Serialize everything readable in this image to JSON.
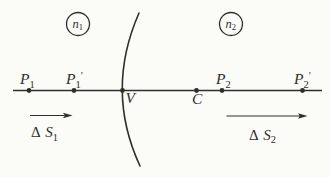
{
  "colors": {
    "background": "#fbfbf8",
    "ink": "#2f2e2c"
  },
  "media": {
    "n1": {
      "base": "n",
      "sub": "1"
    },
    "n2": {
      "base": "n",
      "sub": "2"
    }
  },
  "points": {
    "p1": {
      "base": "P",
      "sub": "1",
      "prime": ""
    },
    "p1_prime": {
      "base": "P",
      "sub": "1",
      "prime": "′"
    },
    "vertex": {
      "base": "V",
      "sub": "",
      "prime": ""
    },
    "center": {
      "base": "C",
      "sub": "",
      "prime": ""
    },
    "p2": {
      "base": "P",
      "sub": "2",
      "prime": ""
    },
    "p2_prime": {
      "base": "P",
      "sub": "2",
      "prime": "′"
    }
  },
  "shifts": {
    "s1": {
      "delta": "Δ",
      "base": "S",
      "sub": "1"
    },
    "s2": {
      "delta": "Δ",
      "base": "S",
      "sub": "2"
    }
  }
}
